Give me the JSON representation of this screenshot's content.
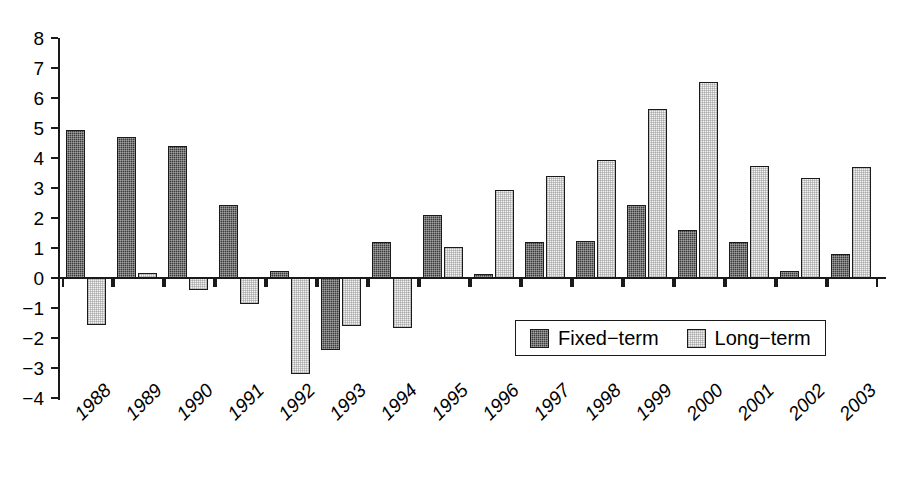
{
  "chart_data": {
    "type": "bar",
    "title": "",
    "subtitle": "",
    "xlabel": "",
    "ylabel": "",
    "grid": false,
    "legend_position": "inside-bottom-right",
    "ylim": [
      -4,
      8
    ],
    "ytick_labels": [
      "8",
      "7",
      "6",
      "5",
      "4",
      "3",
      "2",
      "1",
      "0",
      "−1",
      "−2",
      "−3",
      "−4"
    ],
    "ytick_values": [
      8,
      7,
      6,
      5,
      4,
      3,
      2,
      1,
      0,
      -1,
      -2,
      -3,
      -4
    ],
    "categories": [
      "1988",
      "1989",
      "1990",
      "1991",
      "1992",
      "1993",
      "1994",
      "1995",
      "1996",
      "1997",
      "1998",
      "1999",
      "2000",
      "2001",
      "2002",
      "2003"
    ],
    "series": [
      {
        "name": "Fixed−term",
        "color": "#3b3b3b",
        "values": [
          4.95,
          4.7,
          4.4,
          2.45,
          0.25,
          -2.4,
          1.2,
          2.1,
          0.15,
          1.2,
          1.25,
          2.45,
          1.6,
          1.2,
          0.25,
          0.8
        ]
      },
      {
        "name": "Long−term",
        "color": "#f2f2f2",
        "values": [
          -1.55,
          0.18,
          -0.4,
          -0.85,
          -3.2,
          -1.6,
          -1.65,
          1.05,
          2.95,
          3.4,
          3.95,
          5.65,
          6.55,
          3.75,
          3.35,
          3.7
        ]
      }
    ]
  },
  "legend": {
    "entries": [
      {
        "label": "Fixed−term",
        "swatch": "fixed"
      },
      {
        "label": "Long−term",
        "swatch": "long"
      }
    ]
  }
}
